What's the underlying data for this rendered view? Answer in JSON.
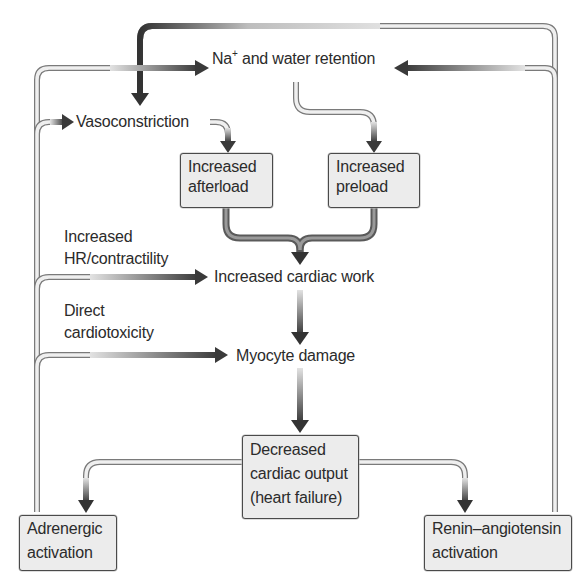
{
  "diagram": {
    "type": "flowchart",
    "nodes": {
      "na_water": {
        "label_main": "Na",
        "label_sup": "+",
        "label_rest": " and water retention"
      },
      "vasoconstriction": {
        "label": "Vasoconstriction"
      },
      "afterload": {
        "line1": "Increased",
        "line2": "afterload"
      },
      "preload": {
        "line1": "Increased",
        "line2": "preload"
      },
      "cardiac_work": {
        "label": "Increased cardiac work"
      },
      "myocyte_damage": {
        "label": "Myocyte damage"
      },
      "decreased_output": {
        "line1": "Decreased",
        "line2": "cardiac output",
        "line3": "(heart failure)"
      },
      "adrenergic": {
        "line1": "Adrenergic",
        "line2": "activation"
      },
      "renin": {
        "line1": "Renin–angiotensin",
        "line2": "activation"
      }
    },
    "edge_labels": {
      "hr_contractility": {
        "line1": "Increased",
        "line2": "HR/contractility"
      },
      "cardiotoxicity": {
        "line1": "Direct",
        "line2": "cardiotoxicity"
      }
    },
    "edges": [
      {
        "from": "decreased_output",
        "to": "adrenergic"
      },
      {
        "from": "decreased_output",
        "to": "renin"
      },
      {
        "from": "adrenergic",
        "to": "vasoconstriction"
      },
      {
        "from": "adrenergic",
        "to": "na_water"
      },
      {
        "from": "adrenergic",
        "to": "cardiac_work",
        "label": "Increased HR/contractility"
      },
      {
        "from": "adrenergic",
        "to": "myocyte_damage",
        "label": "Direct cardiotoxicity"
      },
      {
        "from": "renin",
        "to": "na_water"
      },
      {
        "from": "renin",
        "to": "vasoconstriction"
      },
      {
        "from": "vasoconstriction",
        "to": "afterload"
      },
      {
        "from": "na_water",
        "to": "preload"
      },
      {
        "from": "afterload",
        "to": "cardiac_work"
      },
      {
        "from": "preload",
        "to": "cardiac_work"
      },
      {
        "from": "cardiac_work",
        "to": "myocyte_damage"
      },
      {
        "from": "myocyte_damage",
        "to": "decreased_output"
      }
    ],
    "colors": {
      "box_fill": "#ececec",
      "box_border": "#4a4a4a",
      "arrow_dark": "#3a3a3a",
      "arrow_light": "#d8d8d8"
    }
  }
}
